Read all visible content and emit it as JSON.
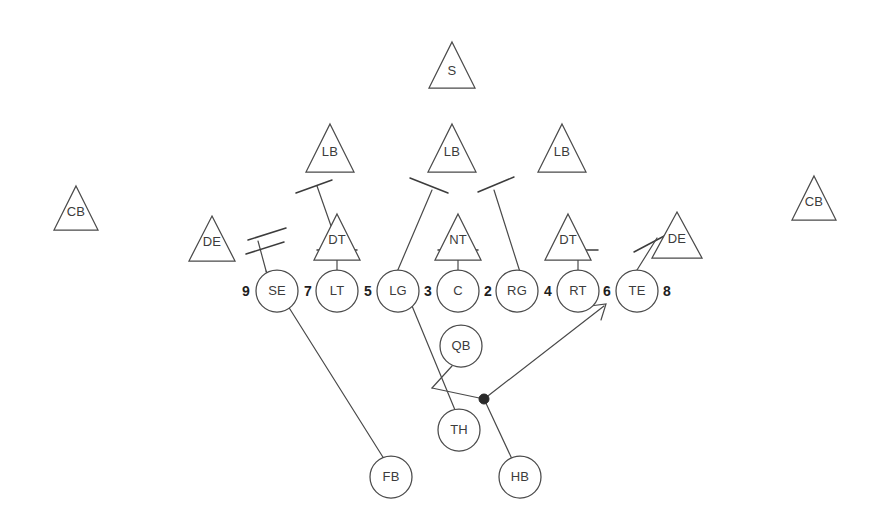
{
  "diagram": {
    "type": "american-football-play",
    "colors": {
      "ink": "#4a4a4a",
      "ink_dark": "#1e1e1e",
      "background": "#ffffff",
      "ball_dot": "#2a2a2a"
    },
    "defense": {
      "shape": "triangle",
      "players": [
        {
          "label": "S",
          "x": 452,
          "y": 65,
          "size": 46
        },
        {
          "label": "LB",
          "x": 330,
          "y": 148,
          "size": 48
        },
        {
          "label": "LB",
          "x": 452,
          "y": 148,
          "size": 48
        },
        {
          "label": "LB",
          "x": 562,
          "y": 148,
          "size": 48
        },
        {
          "label": "CB",
          "x": 76,
          "y": 208,
          "size": 44
        },
        {
          "label": "CB",
          "x": 814,
          "y": 198,
          "size": 44
        },
        {
          "label": "DE",
          "x": 212,
          "y": 238,
          "size": 46
        },
        {
          "label": "DT",
          "x": 337,
          "y": 236,
          "size": 46
        },
        {
          "label": "NT",
          "x": 458,
          "y": 236,
          "size": 46
        },
        {
          "label": "DT",
          "x": 568,
          "y": 236,
          "size": 46
        },
        {
          "label": "DE",
          "x": 677,
          "y": 235,
          "size": 46
        }
      ]
    },
    "offense": {
      "shape": "circle",
      "line_players": [
        {
          "label": "SE",
          "x": 277,
          "y": 291,
          "r": 21
        },
        {
          "label": "LT",
          "x": 337,
          "y": 291,
          "r": 21
        },
        {
          "label": "LG",
          "x": 398,
          "y": 291,
          "r": 21
        },
        {
          "label": "C",
          "x": 458,
          "y": 291,
          "r": 21
        },
        {
          "label": "RG",
          "x": 517,
          "y": 291,
          "r": 21
        },
        {
          "label": "RT",
          "x": 578,
          "y": 291,
          "r": 21
        },
        {
          "label": "TE",
          "x": 637,
          "y": 291,
          "r": 21
        }
      ],
      "backfield_players": [
        {
          "label": "QB",
          "x": 461,
          "y": 346,
          "r": 21
        },
        {
          "label": "TH",
          "x": 459,
          "y": 430,
          "r": 21
        },
        {
          "label": "FB",
          "x": 391,
          "y": 477,
          "r": 21
        },
        {
          "label": "HB",
          "x": 520,
          "y": 477,
          "r": 21
        }
      ]
    },
    "gap_numbers": [
      {
        "value": "9",
        "x": 246,
        "y": 292
      },
      {
        "value": "7",
        "x": 308,
        "y": 292
      },
      {
        "value": "5",
        "x": 368,
        "y": 292
      },
      {
        "value": "3",
        "x": 428,
        "y": 292
      },
      {
        "value": "2",
        "x": 488,
        "y": 292
      },
      {
        "value": "4",
        "x": 548,
        "y": 292
      },
      {
        "value": "6",
        "x": 607,
        "y": 292
      },
      {
        "value": "8",
        "x": 667,
        "y": 292
      }
    ],
    "assignments": {
      "block_c_to_nt": {
        "from": "C",
        "to": "NT",
        "type": "drive-block"
      },
      "block_lt_to_dt": {
        "from": "LT",
        "to": "DT-left",
        "type": "drive-block"
      },
      "block_rt_to_dt": {
        "from": "RT",
        "to": "DT-right",
        "type": "drive-block"
      },
      "block_se_to_lb": {
        "from": "SE",
        "to": "LB-left",
        "type": "angle-block-cross"
      },
      "block_te_to_de": {
        "from": "TE",
        "to": "DE-right",
        "type": "angle-block-cross"
      },
      "block_lg_to_lb": {
        "from": "LG",
        "to": "LB-mid",
        "type": "pull-block"
      },
      "block_rg_to_lb": {
        "from": "RG",
        "to": "LB-mid",
        "type": "pull-block"
      },
      "route_fb": {
        "from": "FB",
        "through": "SE",
        "type": "lead-path"
      },
      "route_qb": {
        "from": "QB",
        "to": "mesh-point",
        "type": "handoff"
      },
      "route_th": {
        "from": "TH",
        "to": "mesh-point",
        "type": "path"
      },
      "route_hb": {
        "from": "HB",
        "to": "ball-point",
        "type": "path"
      },
      "ball_carrier": {
        "from": "ball-point",
        "to": "gap-6",
        "type": "arrow"
      }
    },
    "ball_point": {
      "x": 484,
      "y": 399
    },
    "mesh_point": {
      "x": 432,
      "y": 388
    }
  }
}
